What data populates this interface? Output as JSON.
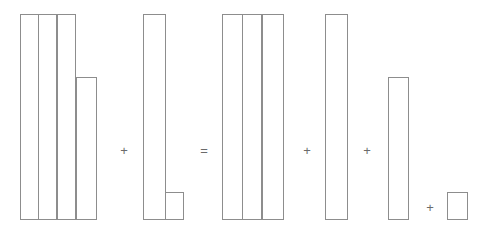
{
  "figure": {
    "type": "bar-decomposition-equation",
    "width": 488,
    "height": 236,
    "background_color": "#ffffff",
    "bar_stroke_color": "#8d8d8d",
    "bar_fill_color": "#ffffff",
    "operator_color": "#6b6b6b",
    "baseline_y": 220
  },
  "operators": {
    "plus": "+",
    "equals": "="
  },
  "chart_data": {
    "type": "bar",
    "title": "",
    "subtitle": "",
    "xlabel": "",
    "ylabel": "",
    "grid": false,
    "legend": "none",
    "baseline_y": 220,
    "top_y_tall": 14,
    "ylim": [
      0,
      206
    ],
    "categories": [
      "bar-1",
      "bar-2",
      "bar-3",
      "bar-4",
      "bar-5",
      "bar-6"
    ],
    "values": [
      206,
      206,
      206,
      143,
      206,
      28
    ],
    "clusters": [
      {
        "name": "left-operand-cluster",
        "role": "operand",
        "bars": [
          {
            "name": "bar-1",
            "x": 20,
            "width": 19,
            "top": 14,
            "height": 206
          },
          {
            "name": "bar-2",
            "x": 39,
            "width": 19,
            "top": 14,
            "height": 206
          },
          {
            "name": "bar-3",
            "x": 58,
            "width": 19,
            "top": 14,
            "height": 206
          },
          {
            "name": "bar-4",
            "x": 77,
            "width": 21,
            "top": 77,
            "height": 143
          }
        ]
      },
      {
        "name": "right-operand-cluster",
        "role": "operand",
        "bars": [
          {
            "name": "bar-5",
            "x": 143,
            "width": 23,
            "top": 14,
            "height": 206
          },
          {
            "name": "bar-6",
            "x": 166,
            "width": 19,
            "top": 192,
            "height": 28
          }
        ]
      },
      {
        "name": "result-cluster-1",
        "role": "result",
        "bars": [
          {
            "name": "bar-1",
            "x": 222,
            "width": 21,
            "top": 14,
            "height": 206
          },
          {
            "name": "bar-2",
            "x": 243,
            "width": 20,
            "top": 14,
            "height": 206
          },
          {
            "name": "bar-3",
            "x": 263,
            "width": 22,
            "top": 14,
            "height": 206
          }
        ]
      },
      {
        "name": "result-cluster-2",
        "role": "result",
        "bars": [
          {
            "name": "bar-5",
            "x": 325,
            "width": 23,
            "top": 14,
            "height": 206
          }
        ]
      },
      {
        "name": "result-cluster-3",
        "role": "result",
        "bars": [
          {
            "name": "bar-4",
            "x": 388,
            "width": 21,
            "top": 77,
            "height": 143
          }
        ]
      },
      {
        "name": "result-cluster-4",
        "role": "result",
        "bars": [
          {
            "name": "bar-6",
            "x": 447,
            "width": 21,
            "top": 192,
            "height": 28
          }
        ]
      }
    ],
    "operators": [
      {
        "name": "operator-plus-1",
        "symbol": "+",
        "x": 124,
        "y": 150
      },
      {
        "name": "operator-equals",
        "symbol": "=",
        "x": 204,
        "y": 150
      },
      {
        "name": "operator-plus-2",
        "symbol": "+",
        "x": 307,
        "y": 150
      },
      {
        "name": "operator-plus-3",
        "symbol": "+",
        "x": 367,
        "y": 150
      },
      {
        "name": "operator-plus-4",
        "symbol": "+",
        "x": 430,
        "y": 207
      }
    ]
  }
}
